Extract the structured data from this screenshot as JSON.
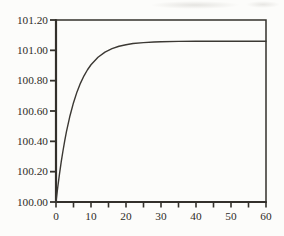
{
  "colors": {
    "background": "#fcfcfa",
    "ink": "#2e2b26",
    "axis": "#33302b",
    "curve": "#3b3833"
  },
  "chart_data": {
    "type": "line",
    "title": "",
    "xlabel": "",
    "ylabel": "",
    "xlim": [
      0,
      60
    ],
    "ylim": [
      100.0,
      101.2
    ],
    "grid": false,
    "frame": "box",
    "legend": null,
    "x_major_ticks": [
      0,
      10,
      20,
      30,
      40,
      50,
      60
    ],
    "x_tick_labels": [
      "0",
      "10",
      "20",
      "30",
      "40",
      "50",
      "60"
    ],
    "x_minor_tick_step": 5,
    "y_ticks": [
      100.0,
      100.2,
      100.4,
      100.6,
      100.8,
      101.0,
      101.2
    ],
    "y_tick_labels": [
      "100.00",
      "100.20",
      "100.40",
      "100.60",
      "100.80",
      "101.00",
      "101.20"
    ],
    "series": [
      {
        "name": "response-curve",
        "asymptote": 101.06,
        "points": [
          [
            0,
            100.0
          ],
          [
            0.5,
            100.097
          ],
          [
            1,
            100.186
          ],
          [
            1.5,
            100.266
          ],
          [
            2,
            100.338
          ],
          [
            2.5,
            100.405
          ],
          [
            3,
            100.465
          ],
          [
            4,
            100.569
          ],
          [
            5,
            100.655
          ],
          [
            6,
            100.726
          ],
          [
            7,
            100.784
          ],
          [
            8,
            100.832
          ],
          [
            9,
            100.872
          ],
          [
            10,
            100.905
          ],
          [
            12,
            100.954
          ],
          [
            14,
            100.988
          ],
          [
            16,
            101.011
          ],
          [
            18,
            101.027
          ],
          [
            20,
            101.037
          ],
          [
            22,
            101.045
          ],
          [
            25,
            101.051
          ],
          [
            28,
            101.055
          ],
          [
            30,
            101.057
          ],
          [
            35,
            101.059
          ],
          [
            40,
            101.06
          ],
          [
            45,
            101.06
          ],
          [
            50,
            101.06
          ],
          [
            55,
            101.06
          ],
          [
            60,
            101.06
          ]
        ]
      }
    ]
  }
}
